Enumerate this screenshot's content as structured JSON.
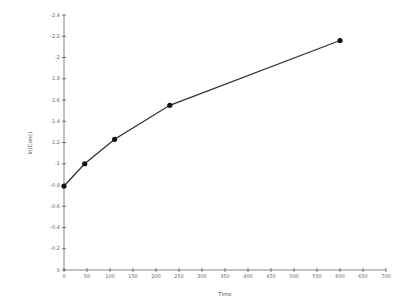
{
  "chart_data": {
    "type": "line",
    "title": "",
    "xlabel": "Time",
    "ylabel": "ln(Conc)",
    "xlim": [
      0,
      700
    ],
    "ylim": [
      0,
      2.4
    ],
    "xticks": [
      0,
      50,
      100,
      150,
      200,
      250,
      300,
      350,
      400,
      450,
      500,
      550,
      600,
      650,
      700
    ],
    "yticks": [
      0,
      0.2,
      0.4,
      0.6,
      0.8,
      1.0,
      1.2,
      1.4,
      1.6,
      1.8,
      2.0,
      2.2,
      2.4
    ],
    "ytick_labels": [
      "0",
      "-0.2",
      "-0.4",
      "-0.6",
      "-0.8",
      "-1",
      "-1.2",
      "-1.4",
      "-1.6",
      "-1.8",
      "-2",
      "-2.2",
      "-2.4"
    ],
    "grid": false,
    "legend": null,
    "series": [
      {
        "name": "data",
        "color": "#333333",
        "marker": "circle",
        "x": [
          0,
          45,
          110,
          230,
          600
        ],
        "y": [
          0.79,
          1.0,
          1.23,
          1.55,
          2.16
        ]
      }
    ]
  }
}
